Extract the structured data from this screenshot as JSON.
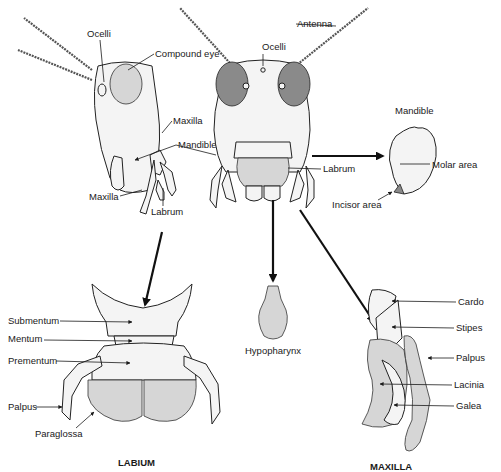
{
  "diagram": {
    "side_view": {
      "labels": {
        "ocelli": "Ocelli",
        "compound_eye": "Compound eye",
        "maxilla_upper": "Maxilla",
        "mandible": "Mandible",
        "maxilla_lower": "Maxilla",
        "labrum": "Labrum"
      }
    },
    "front_view": {
      "labels": {
        "antenna": "Antenna",
        "ocelli": "Ocelli",
        "labrum": "Labrum"
      }
    },
    "mandible_detail": {
      "title": "Mandible",
      "labels": {
        "molar_area": "Molar area",
        "incisor_area": "Incisor area"
      }
    },
    "hypopharynx": {
      "label": "Hypopharynx"
    },
    "labium": {
      "caption": "LABIUM",
      "labels": {
        "submentum": "Submentum",
        "mentum": "Mentum",
        "prementum": "Prementum",
        "palpus": "Palpus",
        "paraglossa": "Paraglossa"
      }
    },
    "maxilla": {
      "caption": "MAXILLA",
      "labels": {
        "cardo": "Cardo",
        "stipes": "Stipes",
        "palpus": "Palpus",
        "lacinia": "Lacinia",
        "galea": "Galea"
      }
    }
  }
}
